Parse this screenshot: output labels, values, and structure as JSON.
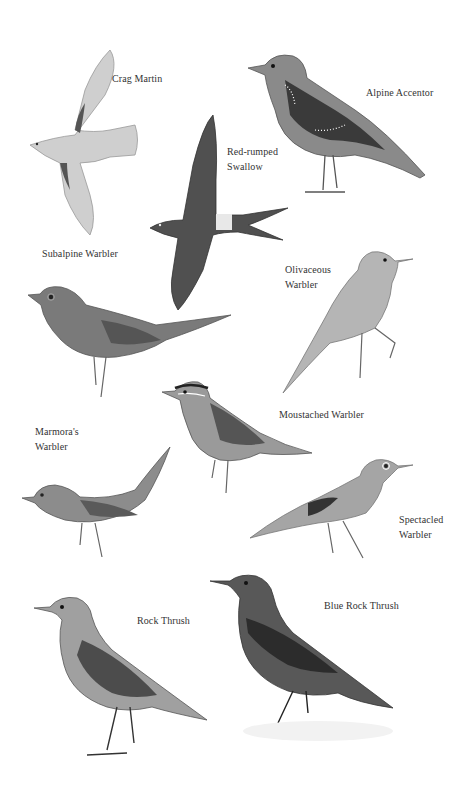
{
  "plate": {
    "background": "#ffffff",
    "ink": "#333333",
    "birds": [
      {
        "name": "Crag Martin",
        "label_lines": "Crag Martin",
        "label_x": 112,
        "label_y": 72
      },
      {
        "name": "Alpine Accentor",
        "label_lines": "Alpine Accentor",
        "label_x": 366,
        "label_y": 86
      },
      {
        "name": "Red-rumped Swallow",
        "label_lines": "Red-rumped\nSwallow",
        "label_x": 227,
        "label_y": 145
      },
      {
        "name": "Subalpine Warbler",
        "label_lines": "Subalpine Warbler",
        "label_x": 42,
        "label_y": 247
      },
      {
        "name": "Olivaceous Warbler",
        "label_lines": "Olivaceous\nWarbler",
        "label_x": 285,
        "label_y": 263
      },
      {
        "name": "Moustached Warbler",
        "label_lines": "Moustached Warbler",
        "label_x": 279,
        "label_y": 408
      },
      {
        "name": "Marmora's Warbler",
        "label_lines": "Marmora's\nWarbler",
        "label_x": 35,
        "label_y": 425
      },
      {
        "name": "Spectacled Warbler",
        "label_lines": "Spectacled\nWarbler",
        "label_x": 399,
        "label_y": 513
      },
      {
        "name": "Blue Rock Thrush",
        "label_lines": "Blue Rock Thrush",
        "label_x": 324,
        "label_y": 599
      },
      {
        "name": "Rock Thrush",
        "label_lines": "Rock Thrush",
        "label_x": 137,
        "label_y": 614
      }
    ]
  }
}
